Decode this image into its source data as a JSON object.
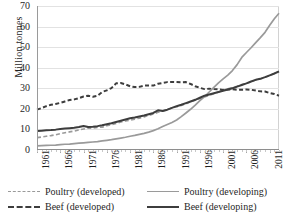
{
  "chart_data": {
    "type": "line",
    "title": "",
    "xlabel": "",
    "ylabel": "Million tonnes",
    "ylim": [
      0,
      70
    ],
    "ytick_step": 10,
    "yticks": [
      0,
      10,
      20,
      30,
      40,
      50,
      60,
      70
    ],
    "xlim": [
      1961,
      2013
    ],
    "xticks": [
      1961,
      1966,
      1971,
      1976,
      1981,
      1986,
      1991,
      1996,
      2001,
      2006,
      2011
    ],
    "xtick_labels": [
      "1961",
      "1966",
      "1971",
      "1976",
      "1981",
      "1986",
      "1991",
      "1996",
      "2001",
      "2006",
      "2011"
    ],
    "grid": true,
    "legend_position": "bottom",
    "x": [
      1961,
      1962,
      1963,
      1964,
      1965,
      1966,
      1967,
      1968,
      1969,
      1970,
      1971,
      1972,
      1973,
      1974,
      1975,
      1976,
      1977,
      1978,
      1979,
      1980,
      1981,
      1982,
      1983,
      1984,
      1985,
      1986,
      1987,
      1988,
      1989,
      1990,
      1991,
      1992,
      1993,
      1994,
      1995,
      1996,
      1997,
      1998,
      1999,
      2000,
      2001,
      2002,
      2003,
      2004,
      2005,
      2006,
      2007,
      2008,
      2009,
      2010,
      2011,
      2012,
      2013
    ],
    "series": [
      {
        "name": "Poultry (developed)",
        "style": "dashed",
        "color": "#9a9a9a",
        "width": 1.6,
        "values": [
          6.0,
          6.3,
          6.7,
          7.0,
          7.4,
          7.9,
          8.4,
          8.8,
          9.2,
          9.7,
          10.2,
          10.7,
          10.6,
          11.0,
          11.1,
          11.8,
          12.3,
          12.9,
          13.6,
          14.1,
          14.5,
          15.0,
          15.5,
          16.1,
          16.8,
          17.5,
          18.3,
          19.0,
          19.6,
          20.4,
          21.0,
          21.6,
          22.4,
          23.4,
          24.2,
          25.0,
          25.8,
          26.6,
          27.4,
          28.2,
          29.0,
          29.8,
          30.3,
          31.0,
          31.8,
          32.3,
          33.2,
          34.1,
          34.6,
          35.3,
          36.2,
          37.2,
          38.0
        ]
      },
      {
        "name": "Beef (developed)",
        "style": "dashed",
        "color": "#3d3d3d",
        "width": 2.0,
        "values": [
          19.6,
          20.4,
          21.3,
          22.0,
          22.4,
          22.9,
          23.6,
          24.3,
          24.6,
          25.2,
          26.0,
          26.4,
          25.9,
          26.4,
          28.2,
          29.0,
          30.1,
          32.4,
          32.6,
          31.9,
          31.0,
          30.6,
          30.7,
          31.3,
          31.4,
          31.3,
          32.2,
          32.6,
          33.0,
          33.1,
          33.0,
          32.9,
          33.0,
          32.1,
          31.0,
          30.2,
          29.6,
          29.8,
          29.6,
          29.5,
          29.2,
          29.4,
          29.5,
          29.3,
          29.3,
          29.4,
          29.3,
          28.9,
          28.5,
          28.4,
          27.7,
          27.2,
          26.4
        ]
      },
      {
        "name": "Poultry (developing)",
        "style": "solid",
        "color": "#9a9a9a",
        "width": 1.7,
        "values": [
          2.0,
          2.1,
          2.2,
          2.3,
          2.4,
          2.6,
          2.8,
          2.9,
          3.1,
          3.3,
          3.5,
          3.7,
          3.9,
          4.1,
          4.4,
          4.7,
          5.0,
          5.4,
          5.8,
          6.2,
          6.7,
          7.1,
          7.6,
          8.1,
          8.7,
          9.4,
          10.3,
          11.4,
          12.4,
          13.4,
          14.6,
          16.2,
          18.0,
          19.8,
          21.8,
          24.0,
          26.0,
          28.2,
          30.4,
          32.6,
          34.6,
          36.4,
          38.6,
          41.5,
          45.0,
          47.4,
          49.7,
          52.2,
          54.6,
          57.2,
          60.6,
          63.8,
          66.5
        ]
      },
      {
        "name": "Beef (developing)",
        "style": "solid",
        "color": "#3d3d3d",
        "width": 2.0,
        "values": [
          9.2,
          9.4,
          9.6,
          9.7,
          9.9,
          10.2,
          10.4,
          10.6,
          10.8,
          11.2,
          11.7,
          11.2,
          11.3,
          11.6,
          12.0,
          12.5,
          13.0,
          13.6,
          14.2,
          14.8,
          15.4,
          15.8,
          16.3,
          16.8,
          17.4,
          18.0,
          19.3,
          19.0,
          19.6,
          20.5,
          21.3,
          22.0,
          22.8,
          23.6,
          24.4,
          25.4,
          26.4,
          27.0,
          27.6,
          28.2,
          28.8,
          29.4,
          30.0,
          30.8,
          31.6,
          32.4,
          33.3,
          34.1,
          34.6,
          35.4,
          36.3,
          37.2,
          38.2
        ]
      }
    ]
  },
  "legend": {
    "items": [
      {
        "label": "Poultry (developed)"
      },
      {
        "label": "Poultry (developing)"
      },
      {
        "label": "Beef (developed)"
      },
      {
        "label": "Beef (developing)"
      }
    ]
  }
}
